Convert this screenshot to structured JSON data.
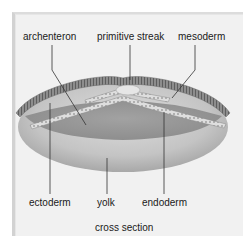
{
  "figure": {
    "caption": "cross section",
    "labels": {
      "archenteron": "archenteron",
      "primitive_streak": "primitive streak",
      "mesoderm": "mesoderm",
      "ectoderm": "ectoderm",
      "yolk": "yolk",
      "endoderm": "endoderm"
    }
  },
  "colors": {
    "panel_background": "#f1f1f1",
    "yolk": "#c9c9c9",
    "archenteron_cavity": "#9d9d9d",
    "ectoderm": "#8a8a8a",
    "mesoderm": "#d8d8d8",
    "endoderm": "#cfcfcf",
    "leader_line": "#333333",
    "text": "#1a1a1a"
  }
}
